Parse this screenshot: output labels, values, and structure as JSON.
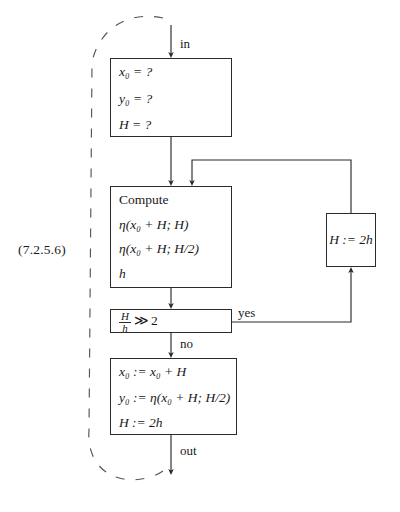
{
  "figure": {
    "equation_number": "(7.2.5.6)",
    "type": "flowchart"
  },
  "nodes": {
    "init": {
      "name": "initialization-box",
      "lines": [
        "x₀ = ?",
        "y₀ = ?",
        "H = ?"
      ]
    },
    "compute": {
      "name": "compute-box",
      "title": "Compute",
      "lines": [
        "η(x₀ + H; H)",
        "η(x₀ + H; H/2)",
        "h"
      ]
    },
    "decision": {
      "name": "decision-box",
      "numerator": "H",
      "denominator": "h",
      "operator": "≫",
      "threshold": "2",
      "text": "H/h ≫ 2"
    },
    "update": {
      "name": "update-box",
      "lines": [
        "x₀ := x₀ + H",
        "y₀ := η(x₀ + H; H/2)",
        "H := 2h"
      ]
    },
    "halve": {
      "name": "step-reset-box",
      "text": "H := 2h"
    }
  },
  "edges": {
    "in_label": "in",
    "yes_label": "yes",
    "no_label": "no",
    "out_label": "out"
  },
  "colors": {
    "stroke": "#2b2b2b",
    "background": "#ffffff",
    "dashed": "#4a4a4a"
  }
}
